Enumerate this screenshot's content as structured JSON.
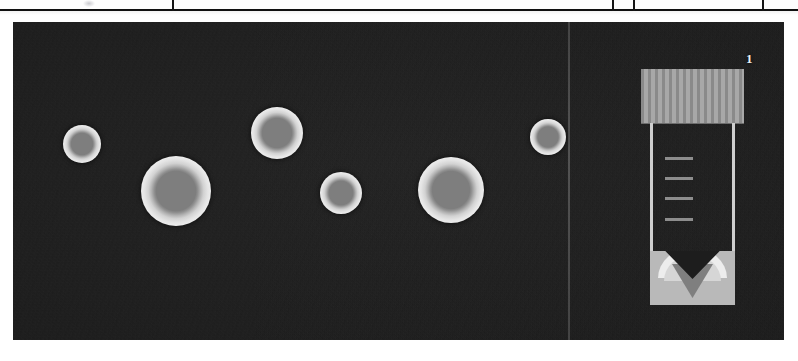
{
  "window": {
    "title": "Colony Imaging Viewer",
    "background_color": "#ffffff"
  },
  "header_strip": {
    "name": "table-header-strip",
    "cropped": true,
    "background_color": "#fdfdfd",
    "border_color": "#101010",
    "ghost_icon": "faint-icon",
    "dividers_x": [
      172,
      612,
      633,
      762
    ]
  },
  "image_panel": {
    "name": "microscopy-image-panel",
    "background_color": "#1d1d1d",
    "x": 13,
    "y": 22,
    "width": 771,
    "height": 318,
    "label": "1",
    "label_color": "#f0f0f0",
    "divider_line": {
      "name": "vertical-scan-line",
      "x": 568,
      "color": "#969696"
    },
    "colonies": [
      {
        "id": "colony-1",
        "cx": 82,
        "cy": 143,
        "r": 19,
        "center_color": "#7e7e7e",
        "ring_color": "#f4f4f4"
      },
      {
        "id": "colony-2",
        "cx": 176,
        "cy": 191,
        "r": 35,
        "center_color": "#7e7e7e",
        "ring_color": "#f4f4f4"
      },
      {
        "id": "colony-3",
        "cx": 277,
        "cy": 133,
        "r": 26,
        "center_color": "#7e7e7e",
        "ring_color": "#f4f4f4"
      },
      {
        "id": "colony-4",
        "cx": 341,
        "cy": 193,
        "r": 21,
        "center_color": "#7e7e7e",
        "ring_color": "#f4f4f4"
      },
      {
        "id": "colony-5",
        "cx": 451,
        "cy": 190,
        "r": 33,
        "center_color": "#7e7e7e",
        "ring_color": "#f4f4f4"
      },
      {
        "id": "colony-6",
        "cx": 548,
        "cy": 128,
        "r": 18,
        "center_color": "#7e7e7e",
        "ring_color": "#f4f4f4"
      }
    ],
    "sample_tube": {
      "name": "sample-tube-graphic",
      "x": 641,
      "y": 69,
      "width": 103,
      "height": 236,
      "cap_color": "#9a9a9a",
      "cap_stripe_color": "#8a8a8a",
      "body_border_color": "#cfcfcf",
      "graduation_color": "#8d8d8d",
      "graduation_count": 4,
      "bottom_color": "#b9b9b9",
      "pellet_color": "#7f7f7f",
      "meniscus_color": "#ededed"
    }
  }
}
